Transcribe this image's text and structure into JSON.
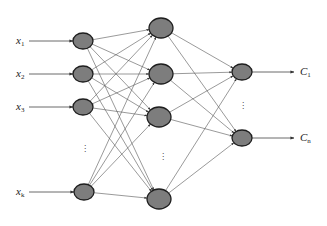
{
  "diagram": {
    "type": "feedforward-neural-network",
    "layers": {
      "input": {
        "labels": [
          {
            "base": "x",
            "sub": "1"
          },
          {
            "base": "x",
            "sub": "2"
          },
          {
            "base": "x",
            "sub": "3"
          },
          {
            "base": "x",
            "sub": "k"
          }
        ],
        "ellipsis": "⋮",
        "nodes": [
          {
            "cx": 83,
            "cy": 41
          },
          {
            "cx": 83,
            "cy": 74
          },
          {
            "cx": 83,
            "cy": 107
          },
          {
            "cx": 84,
            "cy": 192
          }
        ]
      },
      "hidden": {
        "ellipsis": "⋮",
        "nodes": [
          {
            "cx": 161,
            "cy": 28
          },
          {
            "cx": 161,
            "cy": 74
          },
          {
            "cx": 159,
            "cy": 117
          },
          {
            "cx": 159,
            "cy": 199
          }
        ]
      },
      "output": {
        "labels": [
          {
            "base": "C",
            "sub": "1"
          },
          {
            "base": "C",
            "sub": "n"
          }
        ],
        "ellipsis": "⋮",
        "nodes": [
          {
            "cx": 242,
            "cy": 72
          },
          {
            "cx": 242,
            "cy": 138
          }
        ]
      }
    },
    "connectivity": "fully-connected",
    "colors": {
      "node_fill": "#7d7d7d",
      "node_stroke": "#1e1e1e",
      "edge": "#555555"
    }
  }
}
